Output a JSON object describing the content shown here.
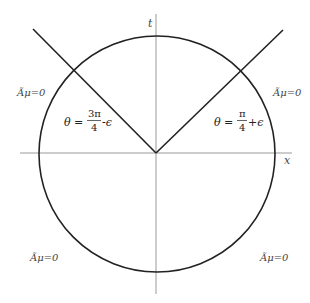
{
  "diagram": {
    "type": "spacetime-circle-diagram",
    "axes": {
      "vertical_label": "t",
      "horizontal_label": "x"
    },
    "regions": {
      "top_left": "Ãμ=0",
      "top_right": "Ãμ=0",
      "bottom_left": "Ãμ=0",
      "bottom_right": "Ãμ=0"
    },
    "lines": {
      "left": {
        "theta_prefix": "θ =",
        "numerator": "3π",
        "denominator": "4",
        "suffix": "-ϵ"
      },
      "right": {
        "theta_prefix": "θ =",
        "numerator": "π",
        "denominator": "4",
        "suffix": "+ϵ"
      }
    },
    "colors": {
      "curve": "#222222",
      "axis": "#999999",
      "text": "#333333"
    }
  }
}
